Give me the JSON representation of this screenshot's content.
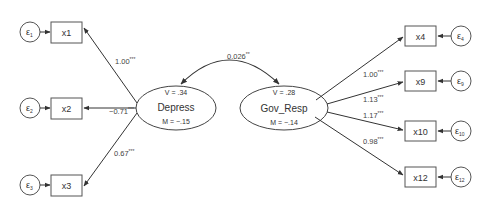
{
  "diagram": {
    "type": "structural-equation-model",
    "latent": [
      {
        "id": "depress",
        "label": "Depress",
        "variance": "V = .34",
        "mean": "M = −.15"
      },
      {
        "id": "gov_resp",
        "label": "Gov_Resp",
        "variance": "V = .28",
        "mean": "M = −.14"
      }
    ],
    "covariance": {
      "value": "0.026",
      "sig": "**"
    },
    "indicators_left": [
      {
        "label": "x1",
        "error": "ε",
        "error_sub": "1",
        "loading": "1.00",
        "sig": "***"
      },
      {
        "label": "x2",
        "error": "ε",
        "error_sub": "2",
        "loading": "−0.71",
        "sig": "***"
      },
      {
        "label": "x3",
        "error": "ε",
        "error_sub": "3",
        "loading": "0.67",
        "sig": "***"
      }
    ],
    "indicators_right": [
      {
        "label": "x4",
        "error": "ε",
        "error_sub": "4",
        "loading": "1.00",
        "sig": "***"
      },
      {
        "label": "x9",
        "error": "ε",
        "error_sub": "9",
        "loading": "1.13",
        "sig": "***"
      },
      {
        "label": "x10",
        "error": "ε",
        "error_sub": "10",
        "loading": "1.17",
        "sig": "***"
      },
      {
        "label": "x12",
        "error": "ε",
        "error_sub": "12",
        "loading": "0.98",
        "sig": "***"
      }
    ],
    "colors": {
      "stroke": "#444444",
      "text": "#333333",
      "background": "#ffffff"
    }
  }
}
